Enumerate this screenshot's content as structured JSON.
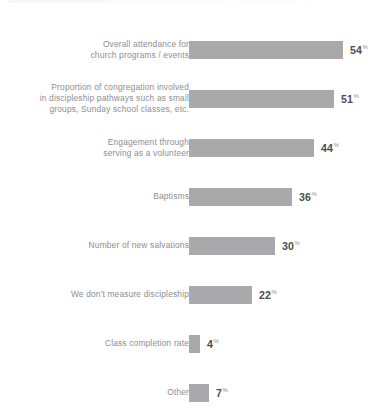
{
  "chart_data": {
    "type": "bar",
    "orientation": "horizontal",
    "title": "",
    "subtitle": "",
    "xlabel": "",
    "ylabel": "",
    "value_suffix": "%",
    "xlim": [
      0,
      60
    ],
    "grid": false,
    "legend": null,
    "bar_color": "#a9a9ab",
    "value_color": "#4c4c4e",
    "label_color": "#8d8d90",
    "background": "#ffffff",
    "categories": [
      "Overall attendance for\nchurch programs / events",
      "Proportion of congregation involved\nin discipleship pathways such as small\ngroups, Sunday school classes, etc.",
      "Engagement through\nserving as a volunteer",
      "Baptisms",
      "Number of new salvations",
      "We don't measure discipleship",
      "Class completion rate",
      "Other"
    ],
    "values": [
      54,
      51,
      44,
      36,
      30,
      22,
      4,
      7
    ],
    "value_labels": [
      "54",
      "51",
      "44",
      "36",
      "30",
      "22",
      "4",
      "7"
    ]
  },
  "rows": [
    {
      "label": "Overall attendance for\nchurch programs / events",
      "value": 54,
      "value_label": "54",
      "pct": "%"
    },
    {
      "label": "Proportion of congregation involved\nin discipleship pathways such as small\ngroups, Sunday school classes, etc.",
      "value": 51,
      "value_label": "51",
      "pct": "%"
    },
    {
      "label": "Engagement through\nserving as a volunteer",
      "value": 44,
      "value_label": "44",
      "pct": "%"
    },
    {
      "label": "Baptisms",
      "value": 36,
      "value_label": "36",
      "pct": "%"
    },
    {
      "label": "Number of new salvations",
      "value": 30,
      "value_label": "30",
      "pct": "%"
    },
    {
      "label": "We don't measure discipleship",
      "value": 22,
      "value_label": "22",
      "pct": "%"
    },
    {
      "label": "Class completion rate",
      "value": 4,
      "value_label": "4",
      "pct": "%"
    },
    {
      "label": "Other",
      "value": 7,
      "value_label": "7",
      "pct": "%"
    }
  ]
}
